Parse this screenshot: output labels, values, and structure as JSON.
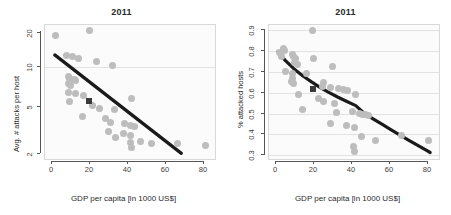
{
  "figure": {
    "background": "#ffffff",
    "dot_color": "#bdbdbd",
    "marker_color": "#3a3a3a",
    "trend_color": "#1a1a1a",
    "grid_color": "#e2e2e2"
  },
  "chart_data": [
    {
      "type": "scatter",
      "panel": "left",
      "title": "2011",
      "xlabel": "GDP per capita [in 1000 US$]",
      "ylabel": "Avg. # attacks per host",
      "xlim": [
        -4,
        92
      ],
      "ylim": [
        1.7,
        24
      ],
      "yscale": "log",
      "xscale": "linear",
      "xticks": [
        0,
        20,
        40,
        60,
        80
      ],
      "xticklabels": [
        "0",
        "20",
        "40",
        "60",
        "80"
      ],
      "yticks": [
        2,
        5,
        10,
        20
      ],
      "yticklabels": [
        "2",
        "5",
        "10",
        "20"
      ],
      "grid": "horizontal-at-10",
      "gridlines": [
        10
      ],
      "legend": "none",
      "points": [
        [
          2.0,
          19.5
        ],
        [
          21.0,
          21.5
        ],
        [
          8.0,
          13.2
        ],
        [
          11.5,
          12.8
        ],
        [
          15.0,
          12.3
        ],
        [
          25.0,
          11.6
        ],
        [
          34.0,
          10.8
        ],
        [
          9.0,
          8.7
        ],
        [
          10.0,
          8.3
        ],
        [
          11.0,
          8.2
        ],
        [
          12.5,
          8.1
        ],
        [
          13.5,
          8.0
        ],
        [
          9.5,
          7.6
        ],
        [
          10.5,
          7.3
        ],
        [
          9.2,
          6.3
        ],
        [
          13.0,
          6.2
        ],
        [
          18.0,
          6.0
        ],
        [
          45.0,
          5.6
        ],
        [
          9.8,
          5.3
        ],
        [
          23.0,
          4.9
        ],
        [
          27.0,
          4.6
        ],
        [
          35.0,
          4.5
        ],
        [
          17.0,
          3.9
        ],
        [
          30.0,
          3.8
        ],
        [
          33.0,
          3.5
        ],
        [
          41.0,
          3.4
        ],
        [
          44.0,
          3.3
        ],
        [
          46.5,
          3.2
        ],
        [
          32.0,
          2.9
        ],
        [
          40.5,
          2.8
        ],
        [
          44.5,
          2.7
        ],
        [
          36.0,
          2.6
        ],
        [
          44.0,
          2.35
        ],
        [
          50.0,
          2.4
        ],
        [
          56.0,
          2.3
        ],
        [
          45.0,
          2.15
        ],
        [
          71.0,
          2.3
        ],
        [
          86.5,
          2.2
        ]
      ],
      "highlight_marker": {
        "x": 21.0,
        "y": 5.4,
        "shape": "square"
      },
      "trendline": {
        "shape": "linear-on-log-y",
        "x0": 1.5,
        "y0": 13.3,
        "x1": 73.0,
        "y1": 1.9
      }
    },
    {
      "type": "scatter",
      "panel": "right",
      "title": "2011",
      "xlabel": "GDP per capita [in 1000 US$]",
      "ylabel": "% attacked hosts",
      "xlim": [
        -4,
        92
      ],
      "ylim": [
        0.27,
        0.93
      ],
      "yscale": "linear",
      "xscale": "linear",
      "xticks": [
        0,
        20,
        40,
        60,
        80
      ],
      "xticklabels": [
        "0",
        "20",
        "40",
        "60",
        "80"
      ],
      "yticks": [
        0.3,
        0.4,
        0.5,
        0.6,
        0.7,
        0.8,
        0.9
      ],
      "yticklabels": [
        "0.3",
        "0.4",
        "0.5",
        "0.6",
        "0.7",
        "0.8",
        "0.9"
      ],
      "grid": "horizontal",
      "gridlines": [
        0.3,
        0.4,
        0.5,
        0.6,
        0.7,
        0.8,
        0.9
      ],
      "legend": "none",
      "points": [
        [
          20.5,
          0.905
        ],
        [
          4.0,
          0.815
        ],
        [
          5.0,
          0.805
        ],
        [
          2.0,
          0.795
        ],
        [
          3.0,
          0.775
        ],
        [
          9.0,
          0.785
        ],
        [
          10.0,
          0.775
        ],
        [
          11.0,
          0.765
        ],
        [
          21.0,
          0.765
        ],
        [
          10.5,
          0.745
        ],
        [
          12.0,
          0.735
        ],
        [
          32.0,
          0.725
        ],
        [
          5.5,
          0.7
        ],
        [
          9.5,
          0.69
        ],
        [
          17.0,
          0.69
        ],
        [
          9.0,
          0.665
        ],
        [
          8.5,
          0.65
        ],
        [
          9.8,
          0.64
        ],
        [
          27.0,
          0.645
        ],
        [
          26.0,
          0.625
        ],
        [
          30.5,
          0.62
        ],
        [
          35.0,
          0.615
        ],
        [
          38.0,
          0.61
        ],
        [
          40.5,
          0.605
        ],
        [
          12.5,
          0.59
        ],
        [
          45.0,
          0.59
        ],
        [
          24.0,
          0.57
        ],
        [
          26.5,
          0.555
        ],
        [
          33.0,
          0.545
        ],
        [
          15.0,
          0.515
        ],
        [
          43.0,
          0.505
        ],
        [
          34.0,
          0.5
        ],
        [
          47.0,
          0.495
        ],
        [
          49.0,
          0.49
        ],
        [
          50.5,
          0.488
        ],
        [
          52.0,
          0.485
        ],
        [
          31.0,
          0.445
        ],
        [
          40.0,
          0.435
        ],
        [
          44.0,
          0.425
        ],
        [
          48.0,
          0.38
        ],
        [
          56.0,
          0.36
        ],
        [
          71.0,
          0.385
        ],
        [
          86.0,
          0.36
        ],
        [
          43.5,
          0.33
        ],
        [
          44.0,
          0.305
        ]
      ],
      "highlight_marker": {
        "x": 21.0,
        "y": 0.615,
        "shape": "square"
      },
      "trendline": {
        "shape": "decaying-curve",
        "points": [
          [
            1.0,
            0.8
          ],
          [
            5,
            0.757
          ],
          [
            10,
            0.715
          ],
          [
            15,
            0.68
          ],
          [
            20,
            0.65
          ],
          [
            25,
            0.622
          ],
          [
            30,
            0.597
          ],
          [
            35,
            0.574
          ],
          [
            40,
            0.553
          ],
          [
            45,
            0.533
          ],
          [
            50,
            0.493
          ],
          [
            55,
            0.466
          ],
          [
            60,
            0.44
          ],
          [
            65,
            0.414
          ],
          [
            70,
            0.388
          ],
          [
            75,
            0.362
          ],
          [
            80,
            0.337
          ],
          [
            85,
            0.312
          ],
          [
            87,
            0.302
          ]
        ]
      }
    }
  ]
}
